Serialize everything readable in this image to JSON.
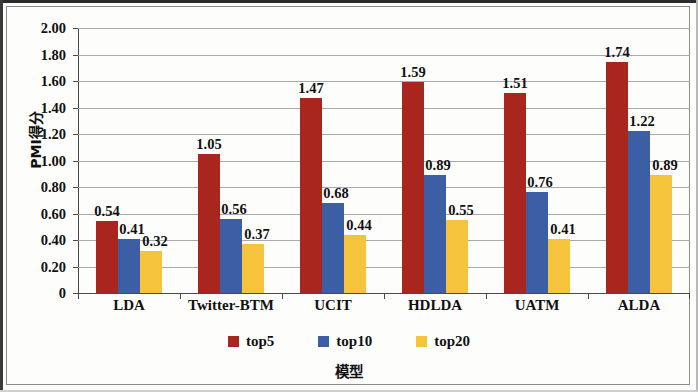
{
  "chart_data": {
    "type": "bar",
    "title": "",
    "xlabel": "模型",
    "ylabel": "PMI得分",
    "ylim": [
      0,
      2.0
    ],
    "ytick_step": 0.2,
    "grid": true,
    "legend_position": "bottom",
    "categories": [
      "LDA",
      "Twitter-BTM",
      "UCIT",
      "HDLDA",
      "UATM",
      "ALDA"
    ],
    "series": [
      {
        "name": "top5",
        "color": "#a8261e",
        "values": [
          0.54,
          1.05,
          1.47,
          1.59,
          1.51,
          1.74
        ],
        "labels": [
          "0.54",
          "1.05",
          "1.47",
          "1.59",
          "1.51",
          "1.74"
        ]
      },
      {
        "name": "top10",
        "color": "#3b5ea5",
        "values": [
          0.41,
          0.56,
          0.68,
          0.89,
          0.76,
          1.22
        ],
        "labels": [
          "0.41",
          "0.56",
          "0.68",
          "0.89",
          "0.76",
          "1.22"
        ]
      },
      {
        "name": "top20",
        "color": "#f6c33d",
        "values": [
          0.32,
          0.37,
          0.44,
          0.55,
          0.41,
          0.89
        ],
        "labels": [
          "0.32",
          "0.37",
          "0.44",
          "0.55",
          "0.41",
          "0.89"
        ]
      }
    ],
    "ytick_labels": [
      "2.00",
      "1.80",
      "1.60",
      "1.40",
      "1.20",
      "1.00",
      "0.80",
      "0.60",
      "0.40",
      "0.20",
      "0"
    ],
    "ytick_values": [
      2.0,
      1.8,
      1.6,
      1.4,
      1.2,
      1.0,
      0.8,
      0.6,
      0.4,
      0.2,
      0
    ]
  }
}
